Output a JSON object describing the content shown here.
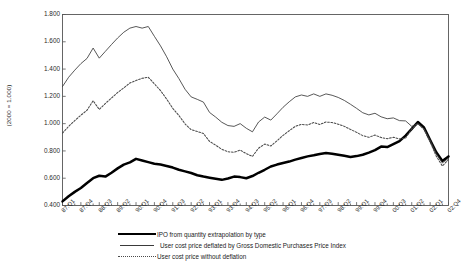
{
  "chart_data": {
    "type": "line",
    "title": "",
    "xlabel": "",
    "ylabel": "(2000 = 1.000)",
    "ylim": [
      0.4,
      1.8
    ],
    "yticks": [
      "0.400",
      "0.600",
      "0.800",
      "1.000",
      "1.200",
      "1.400",
      "1.600",
      "1.800"
    ],
    "ytick_values": [
      0.4,
      0.6,
      0.8,
      1.0,
      1.2,
      1.4,
      1.6,
      1.8
    ],
    "grid": false,
    "legend_position": "below",
    "xtick_labels": [
      "87:Q1",
      "87:Q4",
      "88:Q3",
      "89:Q2",
      "90:Q1",
      "90:Q4",
      "91:Q3",
      "92:Q2",
      "93:Q1",
      "93:Q4",
      "94:Q3",
      "95:Q2",
      "96:Q1",
      "96:Q4",
      "97:Q3",
      "98:Q2",
      "99:Q1",
      "99:Q4",
      "00:Q3",
      "01:Q2",
      "02:Q1",
      "02:Q4"
    ],
    "x": [
      "87:Q1",
      "87:Q2",
      "87:Q3",
      "87:Q4",
      "88:Q1",
      "88:Q2",
      "88:Q3",
      "88:Q4",
      "89:Q1",
      "89:Q2",
      "89:Q3",
      "89:Q4",
      "90:Q1",
      "90:Q2",
      "90:Q3",
      "90:Q4",
      "91:Q1",
      "91:Q2",
      "91:Q3",
      "91:Q4",
      "92:Q1",
      "92:Q2",
      "92:Q3",
      "92:Q4",
      "93:Q1",
      "93:Q2",
      "93:Q3",
      "93:Q4",
      "94:Q1",
      "94:Q2",
      "94:Q3",
      "94:Q4",
      "95:Q1",
      "95:Q2",
      "95:Q3",
      "95:Q4",
      "96:Q1",
      "96:Q2",
      "96:Q3",
      "96:Q4",
      "97:Q1",
      "97:Q2",
      "97:Q3",
      "97:Q4",
      "98:Q1",
      "98:Q2",
      "98:Q3",
      "98:Q4",
      "99:Q1",
      "99:Q2",
      "99:Q3",
      "99:Q4",
      "00:Q1",
      "00:Q2",
      "00:Q3",
      "00:Q4",
      "01:Q1",
      "01:Q2",
      "01:Q3",
      "01:Q4",
      "02:Q1",
      "02:Q2",
      "02:Q3",
      "02:Q4"
    ],
    "series": [
      {
        "name": "IPO from quantity extrapolation by type",
        "style": "thick-solid",
        "color": "#000000",
        "values": [
          0.43,
          0.468,
          0.5,
          0.528,
          0.565,
          0.6,
          0.618,
          0.612,
          0.64,
          0.672,
          0.7,
          0.716,
          0.742,
          0.73,
          0.718,
          0.706,
          0.7,
          0.69,
          0.678,
          0.662,
          0.65,
          0.638,
          0.622,
          0.612,
          0.604,
          0.596,
          0.588,
          0.598,
          0.612,
          0.608,
          0.6,
          0.616,
          0.64,
          0.662,
          0.686,
          0.7,
          0.712,
          0.722,
          0.736,
          0.748,
          0.76,
          0.768,
          0.778,
          0.784,
          0.78,
          0.772,
          0.764,
          0.756,
          0.762,
          0.772,
          0.788,
          0.806,
          0.832,
          0.828,
          0.85,
          0.872,
          0.912,
          0.962,
          1.012,
          0.972,
          0.88,
          0.79,
          0.726,
          0.76
        ]
      },
      {
        "name": "User cost price deflated by Gross Domestic Purchases Price Index",
        "style": "thin-solid",
        "color": "#3a3a3a",
        "values": [
          1.272,
          1.34,
          1.392,
          1.44,
          1.478,
          1.554,
          1.48,
          1.53,
          1.58,
          1.628,
          1.67,
          1.7,
          1.712,
          1.7,
          1.712,
          1.64,
          1.57,
          1.49,
          1.4,
          1.33,
          1.252,
          1.196,
          1.178,
          1.158,
          1.082,
          1.048,
          1.01,
          0.986,
          0.98,
          1.0,
          0.966,
          0.94,
          1.012,
          1.048,
          1.026,
          1.072,
          1.12,
          1.16,
          1.196,
          1.21,
          1.2,
          1.218,
          1.2,
          1.218,
          1.208,
          1.192,
          1.17,
          1.142,
          1.112,
          1.08,
          1.064,
          1.076,
          1.05,
          1.036,
          1.042,
          1.022,
          1.02,
          0.98,
          1.0,
          0.962,
          0.88,
          0.78,
          0.712,
          0.746
        ]
      },
      {
        "name": "User cost price without deflation",
        "style": "dotted",
        "color": "#4a4a4a",
        "values": [
          0.93,
          0.98,
          1.022,
          1.062,
          1.098,
          1.168,
          1.104,
          1.148,
          1.188,
          1.228,
          1.262,
          1.298,
          1.316,
          1.332,
          1.34,
          1.292,
          1.242,
          1.18,
          1.112,
          1.06,
          0.998,
          0.956,
          0.942,
          0.928,
          0.87,
          0.842,
          0.812,
          0.794,
          0.79,
          0.806,
          0.78,
          0.76,
          0.82,
          0.85,
          0.836,
          0.874,
          0.914,
          0.948,
          0.98,
          0.994,
          0.99,
          1.008,
          0.994,
          1.012,
          1.008,
          0.996,
          0.98,
          0.958,
          0.936,
          0.912,
          0.9,
          0.916,
          0.898,
          0.89,
          0.9,
          0.888,
          0.894,
          0.962,
          1.0,
          0.958,
          0.866,
          0.762,
          0.69,
          0.736
        ]
      }
    ]
  },
  "legend": {
    "items": [
      {
        "label": "IPO from quantity extrapolation by type",
        "style": "thick-solid"
      },
      {
        "label": "User cost price deflated by Gross Domestic Purchases Price Index",
        "style": "thin-solid"
      },
      {
        "label": "User cost price without deflation",
        "style": "dotted"
      }
    ]
  },
  "axis": {
    "y_title": "(2000 = 1.000)"
  }
}
